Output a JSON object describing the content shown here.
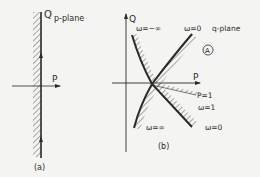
{
  "panel_a": {
    "plane_label": "p-plane",
    "axis_q": "Q",
    "axis_p": "P",
    "caption": "(a)"
  },
  "panel_b": {
    "plane_label": "q-plane",
    "axis_q": "Q",
    "axis_p": "P",
    "region_marker": "A",
    "labels": {
      "omega_neg_inf": "ω=−∞",
      "omega_zero_top": "ω=0",
      "p_eq_1": "P=1",
      "omega_eq_1": "ω=1",
      "omega_inf": "ω=∞",
      "omega_zero_bottom": "ω=0"
    },
    "caption": "(b)"
  },
  "colors": {
    "ink": "#2a2a2a",
    "background": "#f4f4f2"
  }
}
